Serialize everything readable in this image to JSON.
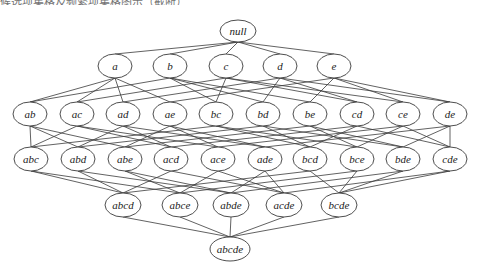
{
  "caption": "候选项集格及频繁项集格图示（截断）",
  "diagram": {
    "type": "itemset-lattice",
    "items": [
      "a",
      "b",
      "c",
      "d",
      "e"
    ],
    "levels": [
      {
        "y": 31,
        "rx": 18,
        "ry": 11,
        "nodes": [
          {
            "label": "null",
            "x": 238
          }
        ]
      },
      {
        "y": 66,
        "rx": 17,
        "ry": 12,
        "nodes": [
          {
            "label": "a",
            "x": 115
          },
          {
            "label": "b",
            "x": 170
          },
          {
            "label": "c",
            "x": 226
          },
          {
            "label": "d",
            "x": 280
          },
          {
            "label": "e",
            "x": 334
          }
        ]
      },
      {
        "y": 114,
        "rx": 17,
        "ry": 12,
        "nodes": [
          {
            "label": "ab",
            "x": 30
          },
          {
            "label": "ac",
            "x": 77
          },
          {
            "label": "ad",
            "x": 123
          },
          {
            "label": "ae",
            "x": 170
          },
          {
            "label": "bc",
            "x": 216
          },
          {
            "label": "bd",
            "x": 263
          },
          {
            "label": "be",
            "x": 310
          },
          {
            "label": "cd",
            "x": 357
          },
          {
            "label": "ce",
            "x": 403
          },
          {
            "label": "de",
            "x": 450
          }
        ]
      },
      {
        "y": 159,
        "rx": 17,
        "ry": 12,
        "nodes": [
          {
            "label": "abc",
            "x": 31
          },
          {
            "label": "abd",
            "x": 78
          },
          {
            "label": "abe",
            "x": 125
          },
          {
            "label": "acd",
            "x": 171
          },
          {
            "label": "ace",
            "x": 218
          },
          {
            "label": "ade",
            "x": 265
          },
          {
            "label": "bcd",
            "x": 310
          },
          {
            "label": "bce",
            "x": 357
          },
          {
            "label": "bde",
            "x": 403
          },
          {
            "label": "cde",
            "x": 450
          }
        ]
      },
      {
        "y": 205,
        "rx": 18,
        "ry": 12,
        "nodes": [
          {
            "label": "abcd",
            "x": 123
          },
          {
            "label": "abce",
            "x": 180
          },
          {
            "label": "abde",
            "x": 231
          },
          {
            "label": "acde",
            "x": 284
          },
          {
            "label": "bcde",
            "x": 339
          }
        ]
      },
      {
        "y": 249,
        "rx": 20,
        "ry": 12,
        "nodes": [
          {
            "label": "abcde",
            "x": 230
          }
        ]
      }
    ]
  }
}
